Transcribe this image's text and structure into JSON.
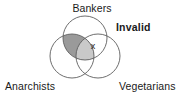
{
  "diagram": {
    "type": "venn-3-circle",
    "title_labels": {
      "top": "Bankers",
      "bottom_left": "Anarchists",
      "bottom_right": "Vegetarians"
    },
    "annotation": {
      "text": "Invalid",
      "bold": true
    },
    "marker": {
      "symbol": "x",
      "region": "bankers-and-vegetarians"
    },
    "shaded_regions": [
      {
        "name": "bankers-and-anarchists-only",
        "color": "#9a9a9a"
      },
      {
        "name": "triple-intersection",
        "color": "#c9c9c9"
      }
    ],
    "colors": {
      "background": "#ffffff",
      "stroke": "#5e5e5e",
      "text": "#1a1a1a",
      "shade_dark": "#9a9a9a",
      "shade_light": "#c9c9c9"
    },
    "circles": [
      {
        "name": "bankers",
        "cx": 85,
        "cy": 38,
        "r": 22
      },
      {
        "name": "anarchists",
        "cx": 72,
        "cy": 56,
        "r": 22
      },
      {
        "name": "vegetarians",
        "cx": 98,
        "cy": 56,
        "r": 22
      }
    ]
  }
}
